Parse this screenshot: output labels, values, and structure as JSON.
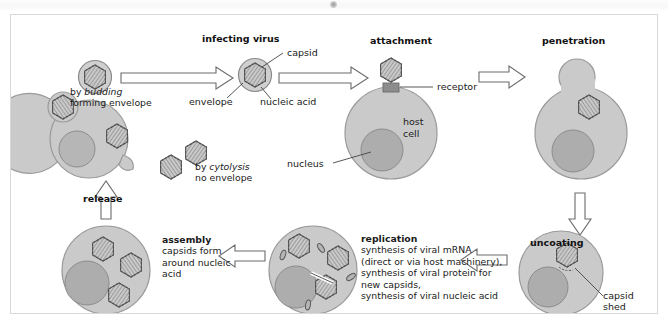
{
  "figure": {
    "kind": "virus-replication-cycle-diagram",
    "colors": {
      "panel_border": "#d8d8d8",
      "page_background": "#ffffff",
      "cell_body": "#cacaca",
      "cell_outline": "#9a9a9a",
      "nucleus_fill": "#a9a9a9",
      "nucleus_outline": "#8c8c8c",
      "virus_fill": "#c4c4c4",
      "virus_outline": "#6e6e6e",
      "arrow_outline": "#6b6b6b",
      "arrow_fill": "#ffffff",
      "leader_line": "#444444",
      "receptor_fill": "#8d8d8d",
      "text": "#1a1a1a"
    }
  },
  "stages": {
    "infecting_virus": {
      "title": "infecting virus"
    },
    "attachment": {
      "title": "attachment"
    },
    "penetration": {
      "title": "penetration"
    },
    "uncoating": {
      "title": "uncoating"
    },
    "replication": {
      "title": "replication",
      "lines": [
        "synthesis of viral mRNA",
        "(direct or via host machinery),",
        "synthesis of viral protein for",
        "new capsids,",
        "synthesis of viral nucleic acid"
      ]
    },
    "assembly": {
      "title": "assembly",
      "lines": [
        "capsids form",
        "around nucleic",
        "acid"
      ]
    },
    "release": {
      "title": "release"
    }
  },
  "annotations": {
    "capsid": "capsid",
    "envelope": "envelope",
    "nucleic_acid": "nucleic acid",
    "receptor": "receptor",
    "host_cell_line1": "host",
    "host_cell_line2": "cell",
    "nucleus": "nucleus",
    "capsid_shed_line1": "capsid",
    "capsid_shed_line2": "shed",
    "budding_prefix": "by ",
    "budding_emphasis": "budding",
    "budding_line2": "forming envelope",
    "cytolysis_prefix": "by ",
    "cytolysis_emphasis": "cytolysis",
    "cytolysis_line2": "no envelope"
  }
}
